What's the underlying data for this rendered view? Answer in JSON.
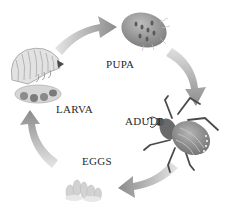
{
  "diagram": {
    "type": "life-cycle",
    "stages": [
      {
        "id": "pupa",
        "label": "PUPA"
      },
      {
        "id": "adult",
        "label": "ADULT"
      },
      {
        "id": "eggs",
        "label": "EGGS"
      },
      {
        "id": "larva",
        "label": "LARVA"
      }
    ],
    "flow": [
      "larva",
      "pupa",
      "adult",
      "eggs",
      "larva"
    ],
    "colors": {
      "arrow": "#8a8a8a",
      "beetle_body": "#6b6b6b",
      "beetle_wing": "#9a9a9a",
      "pupa": "#9b9b9b",
      "larva": "#d8d8d8",
      "eggs": "#cfcfcf",
      "text": "#2a2a2a"
    }
  }
}
